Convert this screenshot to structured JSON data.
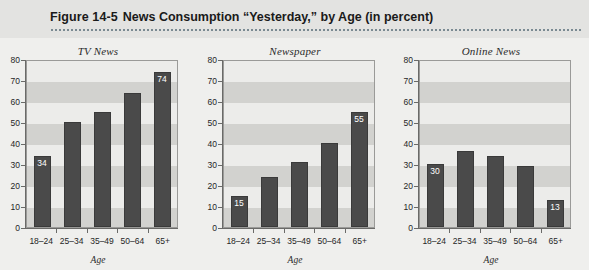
{
  "header": {
    "figure_number": "Figure 14-5",
    "figure_title": "News Consumption “Yesterday,” by Age (in percent)"
  },
  "colors": {
    "page_background": "#efefed",
    "header_background": "#e3e3e1",
    "bar_fill": "#4a4a4a",
    "band_dark": "#d2d2cf",
    "band_light": "#ececea",
    "axis": "#6a6a68",
    "bar_label_text": "#ffffff"
  },
  "chart_data": [
    {
      "type": "bar",
      "title": "TV News",
      "xlabel": "Age",
      "ylabel": "",
      "ylim": [
        0,
        80
      ],
      "yticks": [
        0,
        10,
        20,
        30,
        40,
        50,
        60,
        70,
        80
      ],
      "grid": "horizontal-bands",
      "legend": "none",
      "categories": [
        "18–24",
        "25–34",
        "35–49",
        "50–64",
        "65+"
      ],
      "values": [
        34,
        50,
        55,
        64,
        74
      ],
      "data_labels": [
        "34",
        "",
        "",
        "",
        "74"
      ]
    },
    {
      "type": "bar",
      "title": "Newspaper",
      "xlabel": "Age",
      "ylabel": "",
      "ylim": [
        0,
        80
      ],
      "yticks": [
        0,
        10,
        20,
        30,
        40,
        50,
        60,
        70,
        80
      ],
      "grid": "horizontal-bands",
      "legend": "none",
      "categories": [
        "18–24",
        "25–34",
        "35–49",
        "50–64",
        "65+"
      ],
      "values": [
        15,
        24,
        31,
        40,
        55
      ],
      "data_labels": [
        "15",
        "",
        "",
        "",
        "55"
      ]
    },
    {
      "type": "bar",
      "title": "Online News",
      "xlabel": "Age",
      "ylabel": "",
      "ylim": [
        0,
        80
      ],
      "yticks": [
        0,
        10,
        20,
        30,
        40,
        50,
        60,
        70,
        80
      ],
      "grid": "horizontal-bands",
      "legend": "none",
      "categories": [
        "18–24",
        "25–34",
        "35–49",
        "50–64",
        "65+"
      ],
      "values": [
        30,
        36,
        34,
        29,
        13
      ],
      "data_labels": [
        "30",
        "",
        "",
        "",
        "13"
      ]
    }
  ]
}
